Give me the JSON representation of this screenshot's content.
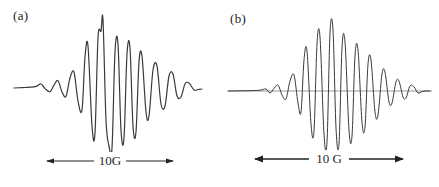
{
  "figure": {
    "background_color": "#ffffff",
    "trace_color": "#3a3a3a",
    "baseline_color": "#6f6f6f",
    "text_color": "#222222"
  },
  "panels": [
    {
      "id": "a",
      "label": "(a)",
      "scalebar": {
        "text": "10G",
        "left_arrow": "arrow-left",
        "right_arrow": "arrow-right",
        "stroke_width": 1.1
      },
      "has_baseline_line": false,
      "trace": {
        "line_width": 1.2,
        "baseline_y": 88,
        "left_tail_x": 14,
        "right_tail_x": 202,
        "envelope_center_x": 103,
        "envelope_width": 58,
        "max_amplitude": 68,
        "oscillation_period": 12.4,
        "points": [
          [
            14,
            88
          ],
          [
            22,
            87.6
          ],
          [
            30,
            87.2
          ],
          [
            36,
            86.4
          ],
          [
            41,
            84.0
          ],
          [
            45,
            88.6
          ],
          [
            50,
            91.8
          ],
          [
            54,
            85.2
          ],
          [
            58,
            80.6
          ],
          [
            62,
            92.0
          ],
          [
            66,
            96.4
          ],
          [
            70,
            78.0
          ],
          [
            74,
            72.0
          ],
          [
            78,
            101.0
          ],
          [
            82,
            110.0
          ],
          [
            85,
            57.0
          ],
          [
            88,
            46.0
          ],
          [
            92,
            126.0
          ],
          [
            95,
            133.0
          ],
          [
            98,
            38.0
          ],
          [
            101,
            31.0
          ],
          [
            103,
            20.0
          ],
          [
            106,
            120.0
          ],
          [
            109,
            146.0
          ],
          [
            112,
            148.0
          ],
          [
            115,
            52.0
          ],
          [
            118,
            44.0
          ],
          [
            121,
            130.0
          ],
          [
            124,
            138.0
          ],
          [
            127,
            54.0
          ],
          [
            130,
            48.0
          ],
          [
            133,
            126.0
          ],
          [
            136,
            132.0
          ],
          [
            139,
            62.0
          ],
          [
            142,
            56.0
          ],
          [
            146,
            112.0
          ],
          [
            149,
            116.0
          ],
          [
            153,
            70.0
          ],
          [
            157,
            66.0
          ],
          [
            161,
            104.0
          ],
          [
            165,
            106.0
          ],
          [
            169,
            76.0
          ],
          [
            173,
            74.0
          ],
          [
            177,
            96.0
          ],
          [
            181,
            97.0
          ],
          [
            185,
            84.0
          ],
          [
            189,
            83.0
          ],
          [
            194,
            90.0
          ],
          [
            198,
            89.5
          ],
          [
            202,
            89.0
          ]
        ]
      }
    },
    {
      "id": "b",
      "label": "(b)",
      "scalebar": {
        "text": "10 G",
        "left_arrow": "arrow-left",
        "right_arrow": "arrow-right",
        "stroke_width": 1.6
      },
      "has_baseline_line": true,
      "trace": {
        "line_width": 1.0,
        "baseline_y": 91,
        "baseline_start_x": 8,
        "baseline_end_x": 212,
        "left_tail_x": 8,
        "right_tail_x": 210,
        "envelope_center_x": 113,
        "envelope_width": 52,
        "max_amplitude": 62,
        "oscillation_period": 12.0,
        "points": [
          [
            8,
            91
          ],
          [
            20,
            90.8
          ],
          [
            32,
            90.6
          ],
          [
            40,
            90.2
          ],
          [
            46,
            89.0
          ],
          [
            50,
            93.0
          ],
          [
            54,
            88.4
          ],
          [
            58,
            85.0
          ],
          [
            62,
            95.0
          ],
          [
            66,
            99.0
          ],
          [
            70,
            81.0
          ],
          [
            74,
            75.0
          ],
          [
            78,
            103.0
          ],
          [
            81,
            112.0
          ],
          [
            84,
            60.0
          ],
          [
            87,
            51.0
          ],
          [
            91,
            124.0
          ],
          [
            94,
            131.0
          ],
          [
            97,
            44.0
          ],
          [
            100,
            37.0
          ],
          [
            104,
            134.0
          ],
          [
            107,
            142.0
          ],
          [
            110,
            33.0
          ],
          [
            113,
            30.0
          ],
          [
            116,
            128.0
          ],
          [
            119,
            144.0
          ],
          [
            122,
            48.0
          ],
          [
            125,
            42.0
          ],
          [
            129,
            130.0
          ],
          [
            132,
            136.0
          ],
          [
            135,
            56.0
          ],
          [
            138,
            50.0
          ],
          [
            142,
            122.0
          ],
          [
            145,
            127.0
          ],
          [
            148,
            64.0
          ],
          [
            151,
            60.0
          ],
          [
            155,
            112.0
          ],
          [
            158,
            115.0
          ],
          [
            162,
            74.0
          ],
          [
            165,
            72.0
          ],
          [
            169,
            102.0
          ],
          [
            172,
            103.0
          ],
          [
            176,
            82.0
          ],
          [
            179,
            81.0
          ],
          [
            183,
            97.0
          ],
          [
            186,
            98.0
          ],
          [
            190,
            86.0
          ],
          [
            194,
            87.0
          ],
          [
            198,
            93.0
          ],
          [
            202,
            91.5
          ],
          [
            206,
            91.0
          ],
          [
            210,
            91.0
          ]
        ]
      }
    }
  ]
}
